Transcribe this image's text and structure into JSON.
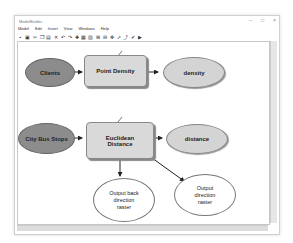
{
  "window": {
    "title": "ModelBuilder",
    "controls": [
      "–",
      "□",
      "×"
    ]
  },
  "menu": [
    "Model",
    "Edit",
    "Insert",
    "View",
    "Windows",
    "Help"
  ],
  "toolbar_icons": [
    "save-icon",
    "print-icon",
    "cut-icon",
    "copy-icon",
    "paste-icon",
    "delete-icon",
    "undo-icon",
    "redo-icon",
    "add-data-icon",
    "auto-layout-icon",
    "full-extent-icon",
    "zoom-in-icon",
    "zoom-out-icon",
    "pan-icon",
    "select-icon",
    "connect-icon",
    "validate-icon",
    "run-icon"
  ],
  "diagram": {
    "row1": {
      "input": "Clients",
      "tool": "Point Density",
      "output": "density"
    },
    "row2": {
      "input": "City Bus Stops",
      "tool": "Euclidean Distance",
      "output": "distance",
      "derived": [
        "Output back direction raster",
        "Output direction raster"
      ]
    }
  },
  "colors": {
    "input_fill": "#8c8c8c",
    "tool_fill": "#d9d9d9",
    "output_fill": "#d4d4d4",
    "derived_fill": "#ffffff"
  }
}
